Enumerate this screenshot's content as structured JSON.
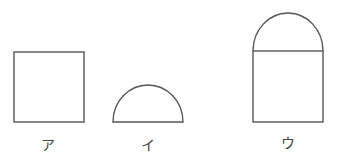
{
  "figures": [
    {
      "id": "a",
      "label": "ア",
      "shape": "square"
    },
    {
      "id": "i",
      "label": "イ",
      "shape": "semicircle"
    },
    {
      "id": "u",
      "label": "ウ",
      "shape": "square-with-semicircle-on-top"
    }
  ],
  "colors": {
    "stroke": "#555555",
    "background": "#ffffff"
  }
}
